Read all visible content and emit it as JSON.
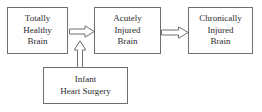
{
  "diagram": {
    "background_color": "#ffffff",
    "box_border_color": "#6e6e6e",
    "text_color": "#2b2b2b",
    "arrow_stroke_color": "#6e6e6e",
    "arrow_fill_color": "#ffffff",
    "nodes": [
      {
        "id": "totally-healthy-brain",
        "lines": [
          "Totally",
          "Healthy",
          "Brain"
        ],
        "x": 7,
        "y": 7,
        "width": 61,
        "height": 47
      },
      {
        "id": "acutely-injured-brain",
        "lines": [
          "Acutely",
          "Injured",
          "Brain"
        ],
        "x": 94,
        "y": 7,
        "width": 67,
        "height": 47
      },
      {
        "id": "chronically-injured-brain",
        "lines": [
          "Chronically",
          "Injured",
          "Brain"
        ],
        "x": 188,
        "y": 7,
        "width": 65,
        "height": 47
      },
      {
        "id": "infant-heart-surgery",
        "lines": [
          "Infant",
          "Heart Surgery"
        ],
        "x": 43,
        "y": 67,
        "width": 85,
        "height": 37
      }
    ],
    "arrows": [
      {
        "id": "healthy-to-acute",
        "direction": "right",
        "from": "totally-healthy-brain",
        "to": "acutely-injured-brain"
      },
      {
        "id": "acute-to-chronic",
        "direction": "right",
        "from": "acutely-injured-brain",
        "to": "chronically-injured-brain"
      },
      {
        "id": "surgery-to-acute",
        "direction": "up",
        "from": "infant-heart-surgery",
        "to": "acutely-injured-brain"
      }
    ]
  }
}
